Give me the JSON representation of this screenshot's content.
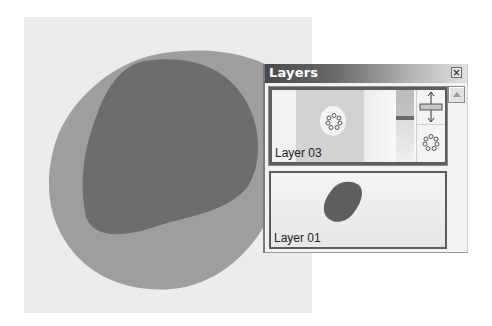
{
  "canvas": {
    "background": "#ececec",
    "outer_shape_color": "#9e9e9e",
    "inner_shape_color": "#6d6d6d"
  },
  "layers_panel": {
    "title": "Layers",
    "close_icon": "close-icon",
    "scroll_icon": "scroll-up-arrow-icon",
    "layers": [
      {
        "name": "Layer 03",
        "selected": true,
        "icons": [
          "transform-handle-icon",
          "selection-marquee-icon",
          "opacity-slider"
        ]
      },
      {
        "name": "Layer 01",
        "selected": false
      }
    ]
  }
}
